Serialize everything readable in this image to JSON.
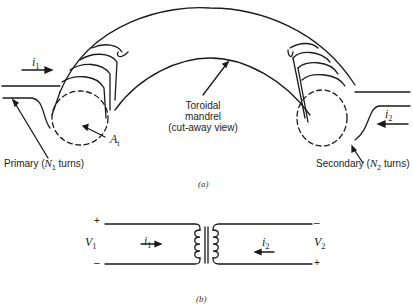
{
  "part_a": {
    "caption": "(a)",
    "current_primary": {
      "symbol": "i",
      "sub": "1"
    },
    "current_secondary": {
      "symbol": "i",
      "sub": "2"
    },
    "area_label": {
      "symbol": "A",
      "sub": "t"
    },
    "mandrel_label": {
      "line1": "Toroidal",
      "line2": "mandrel",
      "line3": "(cut-away view)"
    },
    "primary_label": {
      "prefix": "Primary (",
      "symbol": "N",
      "sub": "1",
      "suffix": " turns)"
    },
    "secondary_label": {
      "prefix": "Secondary (",
      "symbol": "N",
      "sub": "2",
      "suffix": " turns)"
    }
  },
  "part_b": {
    "caption": "(b)",
    "v1": {
      "symbol": "V",
      "sub": "1"
    },
    "v2": {
      "symbol": "V",
      "sub": "2"
    },
    "i1": {
      "symbol": "i",
      "sub": "1"
    },
    "i2": {
      "symbol": "i",
      "sub": "2"
    },
    "v1_plus": "+",
    "v1_minus": "–",
    "v2_minus": "–",
    "v2_plus": "+"
  },
  "colors": {
    "stroke": "#1a1a1a",
    "background": "#ffffff"
  }
}
